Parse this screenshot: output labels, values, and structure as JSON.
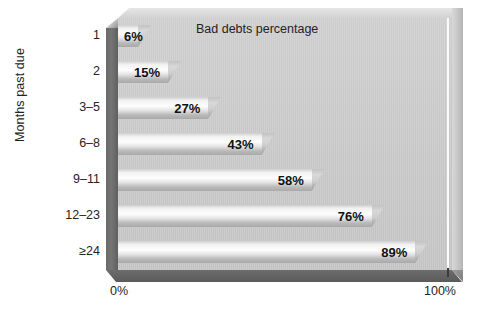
{
  "chart_data": {
    "type": "bar",
    "orientation": "horizontal",
    "title": "Bad debts percentage",
    "xlabel": "",
    "ylabel": "Months past due",
    "categories": [
      "1",
      "2",
      "3–5",
      "6–8",
      "9–11",
      "12–23",
      "≥24"
    ],
    "values": [
      6,
      15,
      27,
      43,
      58,
      76,
      89
    ],
    "value_labels": [
      "6%",
      "15%",
      "27%",
      "43%",
      "58%",
      "76%",
      "89%"
    ],
    "xlim": [
      0,
      100
    ],
    "x_tick_labels": [
      "0%",
      "100%"
    ],
    "grid": false,
    "legend": "none",
    "style_3d": true,
    "colors": {
      "plot_background": "#c8c8c8",
      "bar_fill_light": "#fdfdfd",
      "bar_fill_dark": "#a9a9a9",
      "wall_left": "#6e6e6e",
      "floor": "#626262",
      "wall_right": "#cbcbcb",
      "gridline": "#fbfbfb",
      "text": "#1a1a1a",
      "page_background": "#ffffff"
    }
  },
  "axis": {
    "y_title": "Months past due",
    "x_tick_min": "0%",
    "x_tick_max": "100%"
  },
  "title": {
    "text": "Bad debts percentage"
  }
}
